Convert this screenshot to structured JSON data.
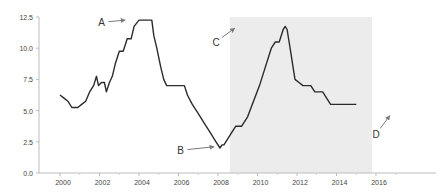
{
  "chart_data": {
    "type": "line",
    "title": "",
    "xlabel": "",
    "ylabel": "",
    "xlim": [
      1999.2,
      2018.0
    ],
    "ylim": [
      0,
      12.5
    ],
    "grid": false,
    "legend": null,
    "x_ticks": [
      "2000",
      "2002",
      "2004",
      "2006",
      "2008",
      "2010",
      "2012",
      "2014",
      "2016"
    ],
    "y_ticks": [
      "0.0",
      "2.5",
      "5.0",
      "7.5",
      "10.0",
      "12.5"
    ],
    "shaded_region": {
      "x_start": 2008.6,
      "x_end": 2015.8,
      "color": "#ececec"
    },
    "series": [
      {
        "name": "rate",
        "color": "#2b2b2b",
        "points": [
          [
            2000.0,
            6.25
          ],
          [
            2000.2,
            6.0
          ],
          [
            2000.4,
            5.75
          ],
          [
            2000.6,
            5.25
          ],
          [
            2000.9,
            5.25
          ],
          [
            2001.1,
            5.5
          ],
          [
            2001.3,
            5.75
          ],
          [
            2001.5,
            6.5
          ],
          [
            2001.7,
            7.0
          ],
          [
            2001.85,
            7.75
          ],
          [
            2001.95,
            7.0
          ],
          [
            2002.1,
            7.25
          ],
          [
            2002.25,
            7.25
          ],
          [
            2002.35,
            6.5
          ],
          [
            2002.5,
            7.25
          ],
          [
            2002.65,
            7.75
          ],
          [
            2002.8,
            8.75
          ],
          [
            2003.0,
            9.75
          ],
          [
            2003.2,
            9.75
          ],
          [
            2003.4,
            10.75
          ],
          [
            2003.6,
            10.75
          ],
          [
            2003.75,
            11.75
          ],
          [
            2004.0,
            12.25
          ],
          [
            2004.1,
            12.25
          ],
          [
            2004.5,
            12.25
          ],
          [
            2004.65,
            12.25
          ],
          [
            2004.75,
            11.0
          ],
          [
            2004.9,
            10.0
          ],
          [
            2005.1,
            8.5
          ],
          [
            2005.25,
            7.5
          ],
          [
            2005.4,
            7.0
          ],
          [
            2005.7,
            7.0
          ],
          [
            2006.0,
            7.0
          ],
          [
            2006.3,
            7.0
          ],
          [
            2006.45,
            6.25
          ],
          [
            2006.7,
            5.5
          ],
          [
            2007.0,
            4.75
          ],
          [
            2007.3,
            4.0
          ],
          [
            2007.6,
            3.25
          ],
          [
            2007.9,
            2.5
          ],
          [
            2008.1,
            2.0
          ],
          [
            2008.2,
            2.25
          ],
          [
            2008.3,
            2.25
          ],
          [
            2008.5,
            2.75
          ],
          [
            2008.7,
            3.25
          ],
          [
            2008.9,
            3.75
          ],
          [
            2009.2,
            3.75
          ],
          [
            2009.5,
            4.5
          ],
          [
            2009.8,
            5.75
          ],
          [
            2010.1,
            7.0
          ],
          [
            2010.4,
            8.5
          ],
          [
            2010.7,
            10.0
          ],
          [
            2010.9,
            10.5
          ],
          [
            2011.1,
            10.5
          ],
          [
            2011.3,
            11.5
          ],
          [
            2011.4,
            11.75
          ],
          [
            2011.5,
            11.5
          ],
          [
            2011.6,
            10.5
          ],
          [
            2011.7,
            9.5
          ],
          [
            2011.8,
            8.5
          ],
          [
            2011.9,
            7.5
          ],
          [
            2012.1,
            7.25
          ],
          [
            2012.3,
            7.0
          ],
          [
            2012.7,
            7.0
          ],
          [
            2012.9,
            6.5
          ],
          [
            2013.3,
            6.5
          ],
          [
            2013.5,
            6.0
          ],
          [
            2013.7,
            5.5
          ],
          [
            2014.2,
            5.5
          ],
          [
            2014.6,
            5.5
          ],
          [
            2015.0,
            5.5
          ]
        ]
      }
    ],
    "annotations": [
      {
        "label": "A",
        "x": 2002.1,
        "y": 11.75,
        "arrow_to": [
          2003.3,
          12.25
        ]
      },
      {
        "label": "B",
        "x": 2006.1,
        "y": 1.5,
        "arrow_to": [
          2007.8,
          2.1
        ]
      },
      {
        "label": "C",
        "x": 2007.9,
        "y": 10.2,
        "arrow_to": [
          2008.85,
          11.6
        ]
      },
      {
        "label": "D",
        "x": 2016.0,
        "y": 2.8,
        "arrow_to": [
          2016.7,
          4.6
        ]
      }
    ]
  }
}
